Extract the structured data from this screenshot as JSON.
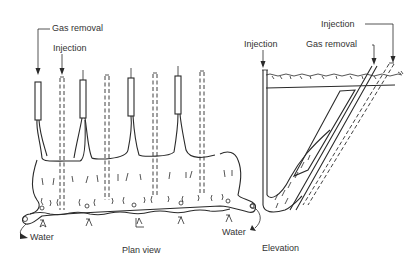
{
  "figure": {
    "plan_view": {
      "caption": "Plan view",
      "labels": {
        "gas_removal": "Gas removal",
        "injection": "Injection",
        "water_left": "Water",
        "water_right": "Water"
      },
      "gas_removal_wells": [
        38,
        83,
        131,
        178
      ],
      "injection_wells": [
        62,
        107,
        155,
        202
      ]
    },
    "elevation": {
      "caption": "Elevation",
      "labels": {
        "injection_vertical": "Injection",
        "gas_removal": "Gas removal",
        "injection_inclined": "Injection"
      }
    },
    "colors": {
      "ink": "#2a2a2a",
      "background": "#ffffff"
    }
  }
}
